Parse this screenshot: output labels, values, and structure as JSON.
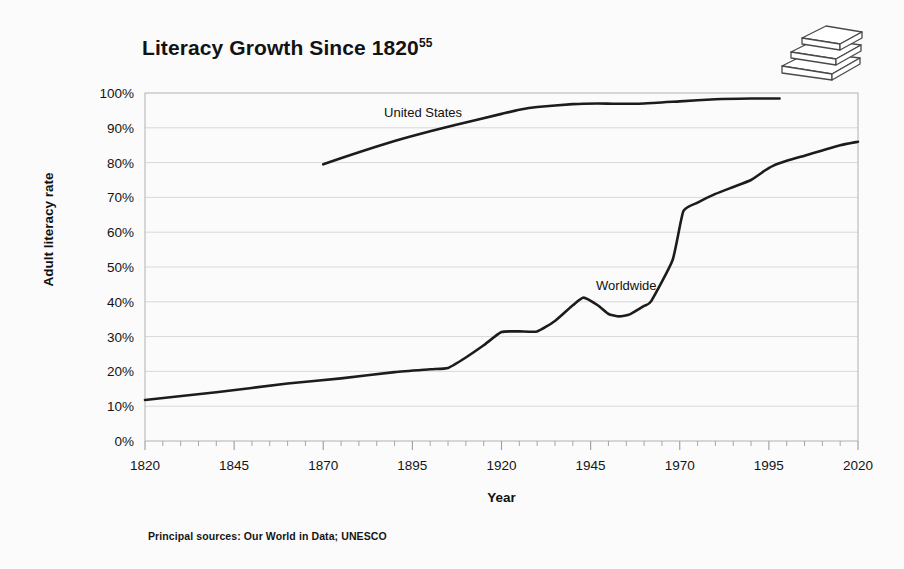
{
  "title": {
    "text": "Literacy Growth Since 1820",
    "superscript": "55"
  },
  "source_note": "Principal sources: Our World in Data; UNESCO",
  "icon": {
    "name": "stacked-books-icon"
  },
  "chart_data": {
    "type": "line",
    "title": "Literacy Growth Since 1820",
    "xlabel": "Year",
    "ylabel": "Adult literacy rate",
    "xlim": [
      1820,
      2020
    ],
    "ylim": [
      0,
      100
    ],
    "grid": true,
    "legend_position": "inline-labels",
    "x_ticks": [
      1820,
      1845,
      1870,
      1895,
      1920,
      1945,
      1970,
      1995,
      2020
    ],
    "x_tick_labels": [
      "1820",
      "1845",
      "1870",
      "1895",
      "1920",
      "1945",
      "1970",
      "1995",
      "2020"
    ],
    "x_minor_tick_step": 5,
    "y_ticks": [
      0,
      10,
      20,
      30,
      40,
      50,
      60,
      70,
      80,
      90,
      100
    ],
    "y_tick_labels": [
      "0%",
      "10%",
      "20%",
      "30%",
      "40%",
      "50%",
      "60%",
      "70%",
      "80%",
      "90%",
      "100%"
    ],
    "line_color": "#1c1c1c",
    "grid_color": "#d8d8d8",
    "series": [
      {
        "name": "United States",
        "label": "United States",
        "label_x": 1898,
        "label_y": 93,
        "x": [
          1870,
          1880,
          1890,
          1900,
          1907,
          1920,
          1925,
          1930,
          1940,
          1947,
          1952,
          1960,
          1970,
          1980,
          1990,
          1998
        ],
        "values": [
          79.5,
          83.0,
          86.2,
          89.0,
          90.8,
          94.0,
          95.2,
          96.0,
          96.8,
          97.0,
          96.9,
          97.0,
          97.6,
          98.2,
          98.4,
          98.4
        ]
      },
      {
        "name": "Worldwide",
        "label": "Worldwide",
        "label_x": 1955,
        "label_y": 43.5,
        "x": [
          1820,
          1840,
          1860,
          1875,
          1890,
          1900,
          1905,
          1910,
          1915,
          1920,
          1925,
          1930,
          1935,
          1940,
          1943,
          1947,
          1950,
          1953,
          1956,
          1960,
          1962,
          1968,
          1971,
          1975,
          1980,
          1985,
          1990,
          1994,
          1996,
          2000,
          2005,
          2010,
          2015,
          2020
        ],
        "values": [
          11.8,
          14.0,
          16.5,
          18.0,
          19.8,
          20.6,
          21.0,
          24.0,
          27.5,
          31.3,
          31.5,
          31.5,
          34.5,
          39.0,
          41.2,
          39.0,
          36.5,
          35.8,
          36.4,
          38.8,
          40.2,
          52.0,
          66.0,
          68.5,
          71.0,
          73.0,
          75.0,
          77.8,
          79.0,
          80.5,
          82.0,
          83.5,
          85.0,
          86.0
        ]
      }
    ]
  }
}
